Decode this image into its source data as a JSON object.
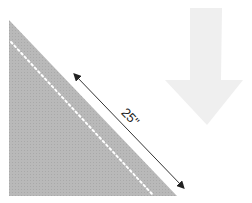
{
  "diagram": {
    "dimension_label": "25\"",
    "colors": {
      "triangle_fill": "#b9b9b9",
      "dotted_line": "#ffffff",
      "dimension_line": "#333333",
      "arrow_fill": "#efefef"
    }
  }
}
